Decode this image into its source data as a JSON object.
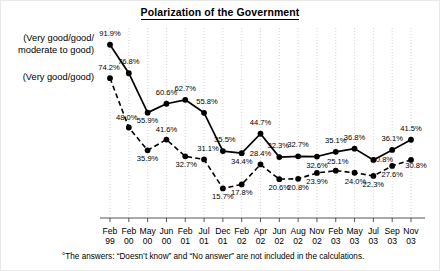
{
  "chart_title": "Polarization of the Government",
  "series_legend": {
    "upper_line1": "(Very good/good/",
    "upper_line2": "moderate to good)",
    "lower": "(Very good/good)"
  },
  "footnote": "°The answers: “Doesn’t know” and “No answer” are not included in the calculations.",
  "chart_data": {
    "type": "line",
    "title": "Polarization of the Government",
    "xlabel": "",
    "ylabel": "",
    "ylim": [
      0,
      100
    ],
    "grid": "vertical-dotted",
    "legend_position": "left-inline",
    "categories": [
      "Feb 99",
      "Feb 00",
      "May 00",
      "Jun 00",
      "Feb 01",
      "Jul 01",
      "Dec 01",
      "Feb 02",
      "Apr 02",
      "Jun 02",
      "Aug 02",
      "Nov 02",
      "Feb 03",
      "May 03",
      "Jul 03",
      "Sep 03",
      "Nov 03"
    ],
    "category_months": [
      "Feb",
      "Feb",
      "May",
      "Jun",
      "Feb",
      "Jul",
      "Dec",
      "Feb",
      "Apr",
      "Jun",
      "Aug",
      "Nov",
      "Feb",
      "May",
      "Jul",
      "Sep",
      "Nov"
    ],
    "category_years": [
      "99",
      "00",
      "00",
      "00",
      "01",
      "01",
      "01",
      "02",
      "02",
      "02",
      "02",
      "02",
      "03",
      "03",
      "03",
      "03",
      "03"
    ],
    "series": [
      {
        "name": "(Very good/good/moderate to good)",
        "style": "solid",
        "color": "#000000",
        "values": [
          91.9,
          76.8,
          55.9,
          60.6,
          62.7,
          55.8,
          35.5,
          34.4,
          44.7,
          32.3,
          32.7,
          32.6,
          35.1,
          36.8,
          30.8,
          36.1,
          41.5
        ],
        "labels": [
          "91.9%",
          "76.8%",
          "55.9%",
          "60.6%",
          "62.7%",
          "55.8%",
          "35.5%",
          "34.4%",
          "44.7%",
          "32.3%",
          "32.7%",
          "32.6%",
          "35.1%",
          "36.8%",
          "30.8%",
          "36.1%",
          "41.5%"
        ]
      },
      {
        "name": "(Very good/good)",
        "style": "dashed",
        "color": "#000000",
        "values": [
          74.2,
          48.0,
          35.9,
          41.6,
          32.7,
          31.1,
          15.7,
          17.8,
          28.4,
          20.6,
          20.8,
          23.9,
          25.1,
          24.0,
          22.3,
          27.6,
          30.8
        ],
        "labels": [
          "74.2%",
          "48.0%",
          "35.9%",
          "41.6%",
          "32.7%",
          "31.1%",
          "15.7%",
          "17.8%",
          "28.4%",
          "20.6%",
          "20.8%",
          "23.9%",
          "25.1%",
          "24.0%",
          "22.3%",
          "27.6%",
          "30.8%"
        ]
      }
    ],
    "label_offsets": {
      "solid": [
        [
          0,
          -9
        ],
        [
          0,
          -9
        ],
        [
          0,
          10
        ],
        [
          0,
          -9
        ],
        [
          0,
          -9
        ],
        [
          3,
          -9
        ],
        [
          2,
          -9
        ],
        [
          0,
          11
        ],
        [
          0,
          -9
        ],
        [
          -1,
          -9
        ],
        [
          0,
          -9
        ],
        [
          0,
          11
        ],
        [
          0,
          -9
        ],
        [
          0,
          -9
        ],
        [
          9,
          2
        ],
        [
          0,
          -9
        ],
        [
          0,
          -9
        ]
      ],
      "dashed": [
        [
          -1,
          -8
        ],
        [
          -2,
          -8
        ],
        [
          0,
          11
        ],
        [
          0,
          -8
        ],
        [
          1,
          11
        ],
        [
          4,
          -8
        ],
        [
          0,
          11
        ],
        [
          0,
          11
        ],
        [
          0,
          -8
        ],
        [
          0,
          11
        ],
        [
          0,
          11
        ],
        [
          0,
          11
        ],
        [
          2,
          -7
        ],
        [
          1,
          11
        ],
        [
          0,
          11
        ],
        [
          0,
          11
        ],
        [
          5,
          8
        ]
      ]
    }
  }
}
